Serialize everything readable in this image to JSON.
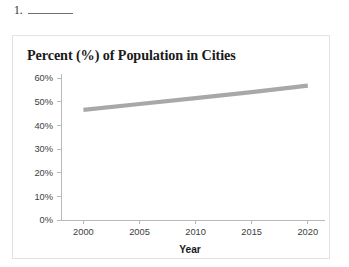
{
  "question": {
    "number": "1.",
    "blank_label": "answer-blank"
  },
  "chart_data": {
    "type": "line",
    "title": "Percent (%) of Population in Cities",
    "xlabel": "Year",
    "ylabel": "",
    "x": [
      2000,
      2005,
      2010,
      2015,
      2020
    ],
    "x_tick_labels": [
      "2000",
      "2005",
      "2010",
      "2015",
      "2020"
    ],
    "y_tick_labels": [
      "0%",
      "10%",
      "20%",
      "30%",
      "40%",
      "50%",
      "60%"
    ],
    "y_tick_values": [
      0,
      10,
      20,
      30,
      40,
      50,
      60
    ],
    "xlim": [
      1998,
      2021
    ],
    "ylim": [
      0,
      60
    ],
    "grid": false,
    "legend": "none",
    "series": [
      {
        "name": "Percent of Population in Cities",
        "color": "#a8a8a8",
        "values": [
          46.5,
          49.0,
          51.5,
          54.0,
          56.8
        ]
      }
    ]
  }
}
